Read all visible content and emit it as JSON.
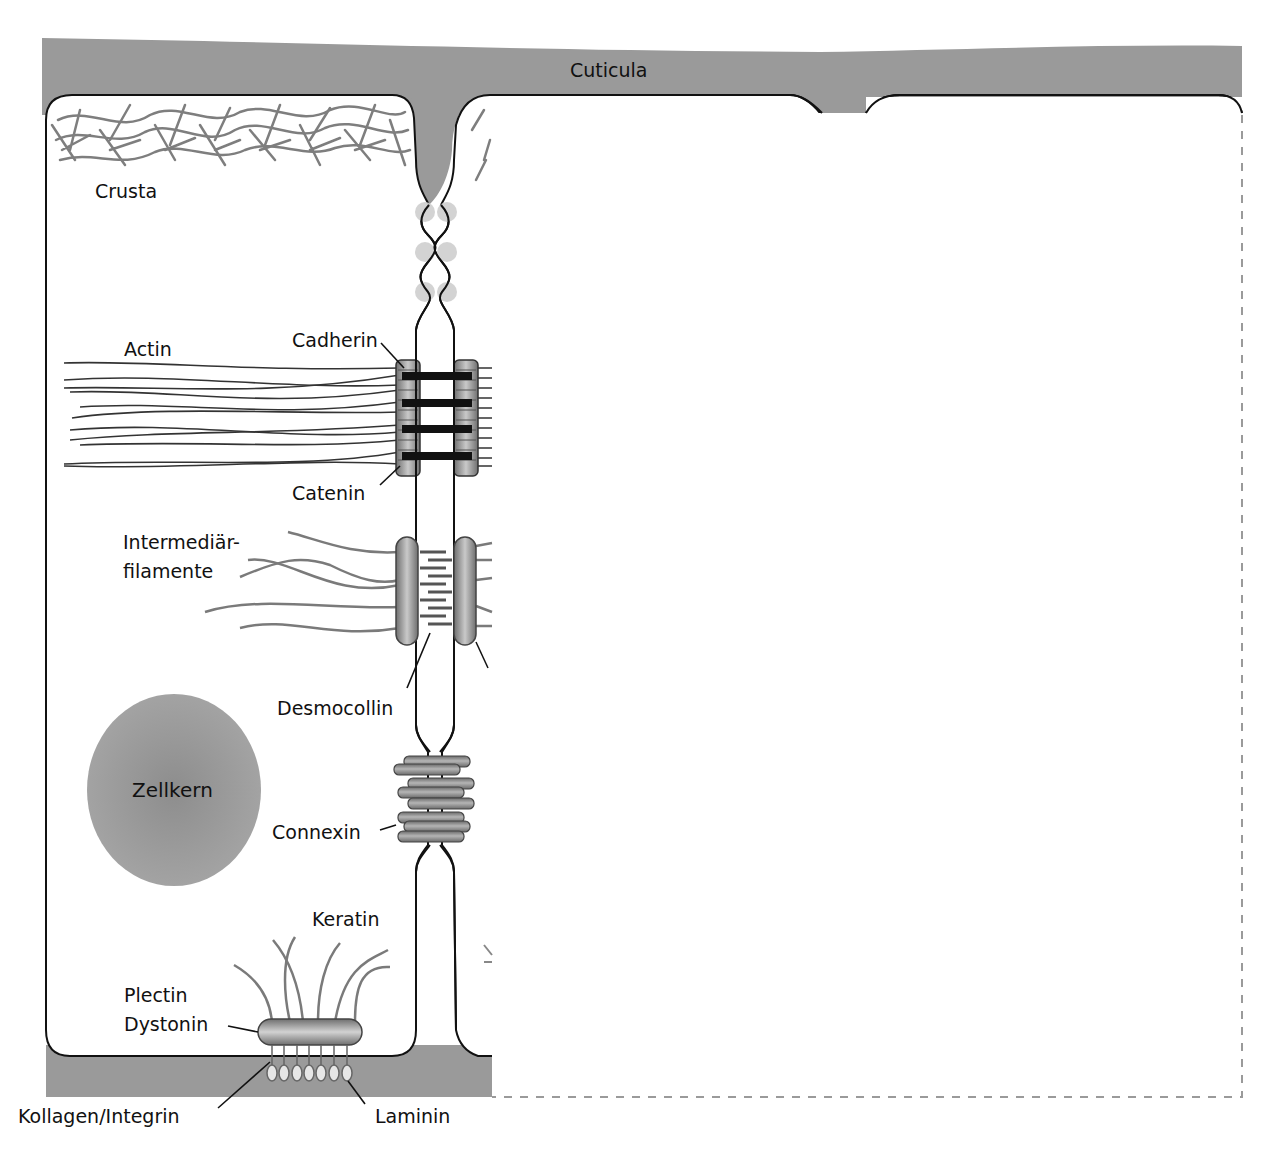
{
  "diagram": {
    "type": "cell-junctions-epithelium",
    "colors": {
      "extracellular": "#9a9a9a",
      "membrane": "#111111",
      "filament_gray": "#7a7a7a",
      "tight_junction_dots": "#cfcfcf",
      "nucleus": "#959595",
      "dashed_outline": "#9a9a9a"
    },
    "labels": {
      "cuticula": "Cuticula",
      "crusta": "Crusta",
      "actin": "Actin",
      "cadherin": "Cadherin",
      "catenin": "Catenin",
      "intermediate_filaments_line1": "Intermediär-",
      "intermediate_filaments_line2": "filamente",
      "desmocollin": "Desmocollin",
      "nucleus": "Zellkern",
      "connexin": "Connexin",
      "keratin": "Keratin",
      "plectin": "Plectin",
      "dystonin": "Dystonin",
      "collagen_integrin": "Kollagen/Integrin",
      "laminin": "Laminin"
    }
  }
}
